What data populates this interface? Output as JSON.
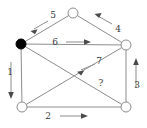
{
  "diagram": {
    "type": "directed-graph",
    "canvas": {
      "width": 147,
      "height": 128
    },
    "background_color": "#ffffff",
    "edge_color": "#8d8d8d",
    "arrow_color": "#4a4a4a",
    "label_color": "#3a3a3a",
    "node_fill_open": "#ffffff",
    "node_fill_marked": "#000000",
    "nodes": [
      {
        "id": "top",
        "label": "",
        "x": 73,
        "y": 13,
        "r": 5,
        "style": "open"
      },
      {
        "id": "left",
        "label": "",
        "x": 21,
        "y": 44,
        "r": 5,
        "style": "filled"
      },
      {
        "id": "right",
        "label": "",
        "x": 126,
        "y": 45,
        "r": 5,
        "style": "open"
      },
      {
        "id": "bottom-left",
        "label": "",
        "x": 22,
        "y": 107,
        "r": 5,
        "style": "open"
      },
      {
        "id": "bottom-right",
        "label": "",
        "x": 126,
        "y": 107,
        "r": 5,
        "style": "open"
      }
    ],
    "edges": [
      {
        "id": "edge-1",
        "label": "1",
        "from": "left",
        "to": "bottom-left",
        "label_x": 10,
        "label_y": 72,
        "arrow_direction": "down",
        "arrow_x": 11,
        "arrow_y": 96
      },
      {
        "id": "edge-2",
        "label": "2",
        "from": "bottom-left",
        "to": "bottom-right",
        "label_x": 48,
        "label_y": 116,
        "arrow_direction": "right",
        "arrow_x": 85,
        "arrow_y": 116
      },
      {
        "id": "edge-3",
        "label": "3",
        "from": "bottom-right",
        "to": "right",
        "label_x": 137,
        "label_y": 85,
        "arrow_direction": "up",
        "arrow_x": 136,
        "arrow_y": 60
      },
      {
        "id": "edge-4",
        "label": "4",
        "from": "right",
        "to": "top",
        "label_x": 118,
        "label_y": 29,
        "arrow_direction": "up-left",
        "arrow_x": 97,
        "arrow_y": 16
      },
      {
        "id": "edge-5",
        "label": "5",
        "from": "top",
        "to": "left",
        "label_x": 53,
        "label_y": 15,
        "arrow_direction": "down-left",
        "arrow_x": 33,
        "arrow_y": 28
      },
      {
        "id": "edge-6",
        "label": "6",
        "from": "left",
        "to": "right",
        "label_x": 55,
        "label_y": 42,
        "arrow_direction": "right",
        "arrow_x": 88,
        "arrow_y": 42
      },
      {
        "id": "edge-7",
        "label": "7",
        "from": "right",
        "to": "bottom-left",
        "label_x": 99,
        "label_y": 61,
        "arrow_direction": "down-left",
        "arrow_x": 79,
        "arrow_y": 70
      },
      {
        "id": "edge-8",
        "label": "?",
        "from": "left",
        "to": "bottom-right",
        "label_x": 101,
        "label_y": 83,
        "arrow_direction": "none",
        "arrow_x": 0,
        "arrow_y": 0
      }
    ]
  }
}
